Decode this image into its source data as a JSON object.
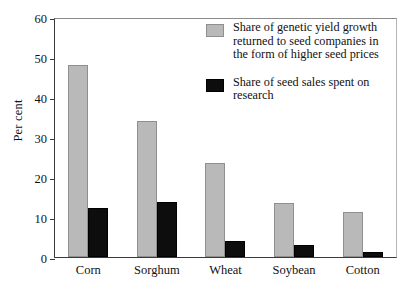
{
  "chart_data": {
    "type": "bar",
    "title": "",
    "xlabel": "",
    "ylabel": "Per cent",
    "ylim": [
      0,
      60
    ],
    "yticks": [
      0,
      10,
      20,
      30,
      40,
      50,
      60
    ],
    "grid": false,
    "legend_position": "top-right",
    "categories": [
      "Corn",
      "Sorghum",
      "Wheat",
      "Soybean",
      "Cotton"
    ],
    "series": [
      {
        "name": "Share of genetic yield growth returned to seed companies in the form of higher seed prices",
        "color": "#b9b9b9",
        "values": [
          48,
          34,
          23.5,
          13.5,
          11.3
        ]
      },
      {
        "name": "Share of seed sales spent on research",
        "color": "#0d0d0d",
        "values": [
          12.3,
          13.8,
          3.9,
          3.0,
          1.3
        ]
      }
    ]
  },
  "legend": {
    "items": [
      {
        "swatch": "gray",
        "lines": [
          "Share of genetic yield growth",
          "returned to seed companies in",
          "the form of higher seed prices"
        ]
      },
      {
        "swatch": "black",
        "lines": [
          "Share of seed sales spent on",
          "research"
        ]
      }
    ]
  }
}
